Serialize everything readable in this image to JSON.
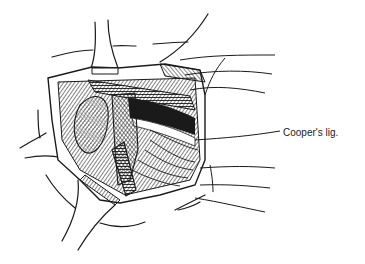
{
  "figure": {
    "labels": [
      {
        "text": "Cooper's lig.",
        "x": 283,
        "y": 133
      }
    ],
    "leader_line_count": 9,
    "colors": {
      "ink": "#1a1a1a",
      "background": "#ffffff"
    }
  }
}
